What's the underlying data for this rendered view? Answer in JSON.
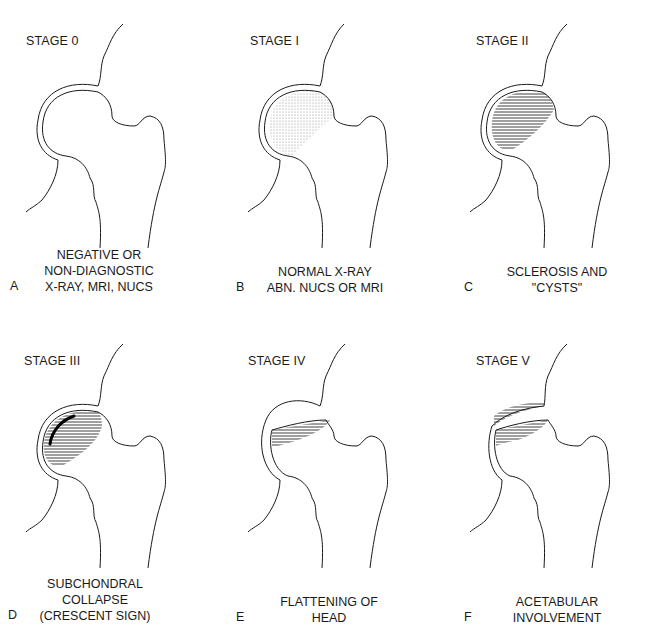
{
  "figure": {
    "panels": [
      {
        "letter": "A",
        "stage": "STAGE 0",
        "caption": [
          "NEGATIVE OR",
          "NON-DIAGNOSTIC",
          "X-RAY, MRI, NUCS"
        ],
        "variant": "normal"
      },
      {
        "letter": "B",
        "stage": "STAGE I",
        "caption": [
          "NORMAL X-RAY",
          "ABN. NUCS OR MRI"
        ],
        "variant": "stippled"
      },
      {
        "letter": "C",
        "stage": "STAGE II",
        "caption": [
          "SCLEROSIS AND",
          "\"CYSTS\""
        ],
        "variant": "sclerosis"
      },
      {
        "letter": "D",
        "stage": "STAGE III",
        "caption": [
          "SUBCHONDRAL",
          "COLLAPSE",
          "(CRESCENT SIGN)"
        ],
        "variant": "crescent"
      },
      {
        "letter": "E",
        "stage": "STAGE IV",
        "caption": [
          "FLATTENING OF",
          "HEAD"
        ],
        "variant": "flattened"
      },
      {
        "letter": "F",
        "stage": "STAGE V",
        "caption": [
          "ACETABULAR",
          "INVOLVEMENT"
        ],
        "variant": "acetabular"
      }
    ],
    "colors": {
      "line": "#1a1a1a",
      "stipple": "#9a9a9a",
      "hatch": "#2a2a2a"
    }
  }
}
